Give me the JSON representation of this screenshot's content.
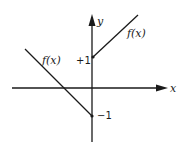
{
  "diagram": {
    "type": "piecewise-linear-function-graph",
    "axes": {
      "x_label": "x",
      "y_label": "y"
    },
    "ticks": {
      "plus_one": "+1",
      "minus_one": "−1"
    },
    "curves": [
      {
        "name": "left-branch",
        "label": "f(x)",
        "description": "line with slope -1 for x<0, ending at (0,-1)"
      },
      {
        "name": "right-branch",
        "label": "f(x)",
        "description": "line with slope +1 for x>0, starting at (0,+1)"
      }
    ],
    "colors": {
      "ink": "#1a1a1a",
      "background": "#ffffff"
    }
  }
}
